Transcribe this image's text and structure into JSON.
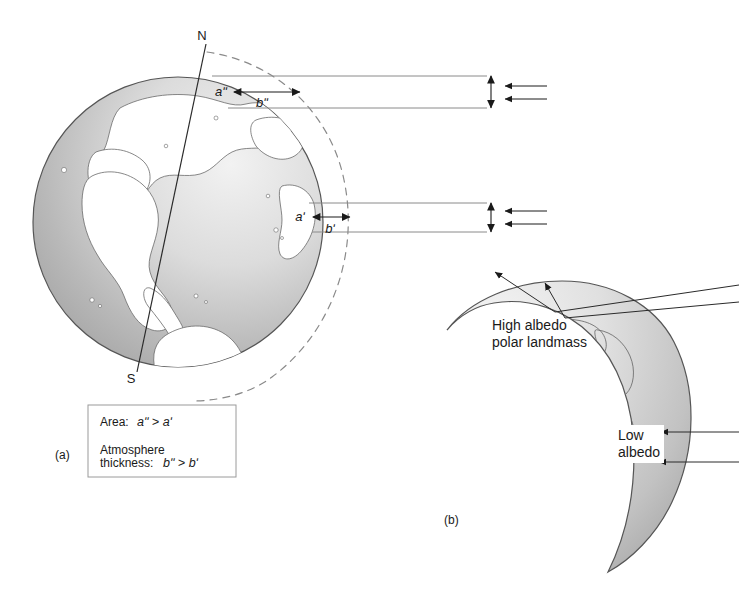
{
  "figure": {
    "background_color": "#ffffff",
    "panels": [
      {
        "id": "a",
        "label": "(a)",
        "pole_north": "N",
        "pole_south": "S",
        "measurements": {
          "upper_area": "aʺ",
          "upper_thickness": "bʺ",
          "lower_area": "aʹ",
          "lower_thickness": "bʹ"
        },
        "legend_box": {
          "row1_label": "Area:",
          "row1_value": "aʺ > aʹ",
          "row2_label_line1": "Atmosphere",
          "row2_label_line2": "thickness:",
          "row2_value": "bʺ > bʹ"
        }
      },
      {
        "id": "b",
        "label": "(b)",
        "annotations": {
          "high_albedo_line1": "High albedo",
          "high_albedo_line2": "polar landmass",
          "low_albedo_line1": "Low",
          "low_albedo_line2": "albedo"
        }
      }
    ],
    "colors": {
      "ocean_dark": "#a8a8a8",
      "ocean_light": "#e8e8e8",
      "land": "#ffffff",
      "outline": "#4a4a4a",
      "ray_line": "#7a7a7a",
      "arrow": "#1a1a1a",
      "dashed_atmosphere": "#8a8a8a"
    }
  }
}
